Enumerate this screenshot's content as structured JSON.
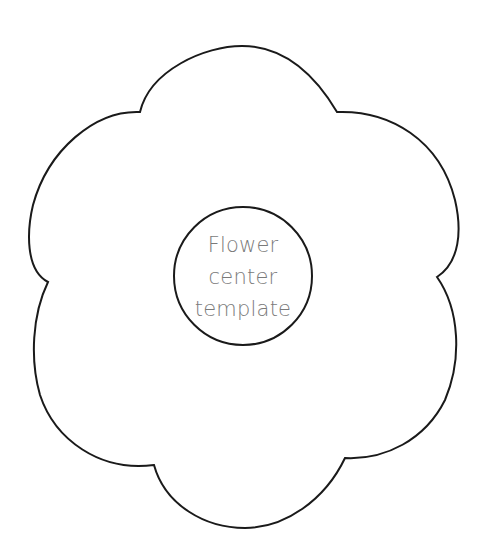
{
  "template": {
    "title": "Flower template",
    "petal_count": 6,
    "outline_color": "#1a1a1a",
    "background_color": "#ffffff"
  },
  "center_circle": {
    "label_lines": [
      "Flower",
      "center",
      "template"
    ],
    "label_color": "#7a7a7a",
    "cx": 243,
    "cy": 276,
    "r": 69
  }
}
